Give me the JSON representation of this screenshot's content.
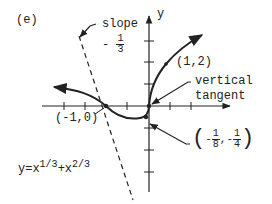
{
  "figure": {
    "panel_label": "(e)",
    "equation": {
      "base": "y=x",
      "exp1": "1/3",
      "plus": "+x",
      "exp2": "2/3"
    },
    "axis": {
      "y_label": "y"
    },
    "slope_annotation": {
      "word": "slope",
      "sign": "-",
      "num": "1",
      "den": "3"
    },
    "point_1_2": "(1,2)",
    "point_neg1_0": "(-1,0)",
    "vertical_tangent": {
      "line1": "vertical",
      "line2": "tangent"
    },
    "min_point": {
      "open": "(",
      "sign1": "-",
      "num1": "1",
      "den1": "8",
      "comma": ",",
      "sign2": "-",
      "num2": "1",
      "den2": "4",
      "close": ")"
    },
    "colors": {
      "ink": "#222222",
      "background": "#ffffff"
    }
  }
}
